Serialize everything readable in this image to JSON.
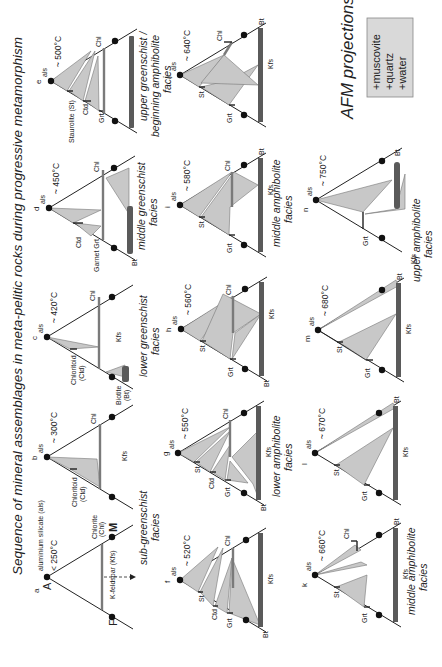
{
  "title": "Sequence of mineral assemblages in meta-pelitic rocks during progressive metamorphism",
  "afm": {
    "title": "AFM projections",
    "box_lines": [
      "+muscovite",
      "+quartz",
      "+water"
    ]
  },
  "vertices": {
    "A": "A",
    "F": "F",
    "M": "M"
  },
  "panel_a_labels": {
    "als": "aluminium silicate (als)",
    "chl_1": "Chlorite",
    "chl_2": "(Chl)",
    "kfs": "K-feldspar (Kfs)"
  },
  "mineral_labels": {
    "als": "als",
    "chl": "Chl",
    "kfs": "Kfs",
    "bt": "Bt",
    "grt": "Grt",
    "st": "St",
    "ctd": "Ctd",
    "chloritoid_1": "Chloritoid",
    "chloritoid_2": "(Ctd)",
    "biotite_1": "Biotite",
    "biotite_2": "(Bt)",
    "garnet": "Garnet Grt",
    "staurolite": "Staurolite (St)"
  },
  "panels": [
    {
      "id": "a",
      "temp": "< 250°C"
    },
    {
      "id": "b",
      "temp": "~ 300°C"
    },
    {
      "id": "c",
      "temp": "~ 420°C"
    },
    {
      "id": "d",
      "temp": "~ 450°C"
    },
    {
      "id": "e",
      "temp": "~ 500°C"
    },
    {
      "id": "f",
      "temp": "~ 520°C"
    },
    {
      "id": "g",
      "temp": "~ 550°C"
    },
    {
      "id": "h",
      "temp": "~ 560°C"
    },
    {
      "id": "i",
      "temp": "~ 580°C"
    },
    {
      "id": "j",
      "temp": "~ 640°C"
    },
    {
      "id": "k",
      "temp": "~ 660°C"
    },
    {
      "id": "l",
      "temp": "~ 670°C"
    },
    {
      "id": "m",
      "temp": "~ 680°C"
    },
    {
      "id": "n",
      "temp": "~ 750°C"
    }
  ],
  "facies": {
    "sub_greenschist": [
      "sub-greenschist",
      "facies"
    ],
    "lower_greenschist": [
      "lower greenschist",
      "facies"
    ],
    "middle_greenschist": [
      "middle greenschist",
      "facies"
    ],
    "upper_greenschist": [
      "upper greenschist /",
      "beginning amphibolite",
      "facies"
    ],
    "lower_amphibolite": [
      "lower amphibolite",
      "facies"
    ],
    "middle_amphibolite_1": [
      "middle amphibolite",
      "facies"
    ],
    "middle_amphibolite_2": [
      "middle amphibolite",
      "facies"
    ],
    "upper_amphibolite": [
      "upper amphibolite",
      "facies"
    ]
  }
}
